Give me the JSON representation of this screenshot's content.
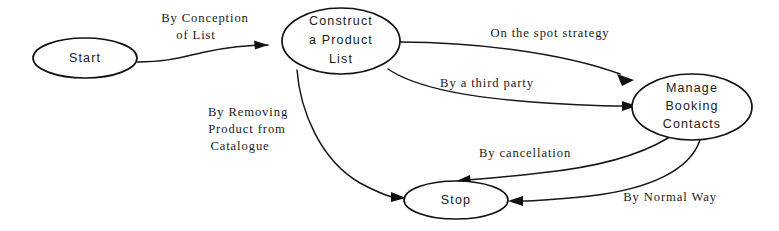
{
  "diagram": {
    "type": "state-transition-diagram",
    "background_color": "#ffffff",
    "stroke_color": "#171717",
    "text_color": "#1a1a1a",
    "nodes": [
      {
        "id": "start",
        "name": "start-node",
        "label_lines": [
          "Start"
        ],
        "cx": 85,
        "cy": 58,
        "rx": 52,
        "ry": 20
      },
      {
        "id": "construct",
        "name": "construct-product-list-node",
        "label_lines": [
          "Construct",
          "a Product",
          "List"
        ],
        "cx": 341,
        "cy": 41,
        "rx": 59,
        "ry": 33
      },
      {
        "id": "manage",
        "name": "manage-booking-contacts-node",
        "label_lines": [
          "Manage",
          "Booking",
          "Contacts"
        ],
        "cx": 692,
        "cy": 107,
        "rx": 60,
        "ry": 33
      },
      {
        "id": "stop",
        "name": "stop-node",
        "label_lines": [
          "Stop"
        ],
        "cx": 456,
        "cy": 200,
        "rx": 52,
        "ry": 19
      }
    ],
    "edges": [
      {
        "id": "start-to-construct",
        "name": "edge-start-to-construct",
        "from": "start",
        "to": "construct",
        "label_lines": [
          "By Conception",
          "of List"
        ],
        "label_x": 205,
        "label_y": 26
      },
      {
        "id": "construct-to-manage-spot",
        "name": "edge-construct-to-manage-on-the-spot",
        "from": "construct",
        "to": "manage",
        "label_lines": [
          "On the spot strategy"
        ],
        "label_x": 550,
        "label_y": 34
      },
      {
        "id": "construct-to-manage-third-party",
        "name": "edge-construct-to-manage-third-party",
        "from": "construct",
        "to": "manage",
        "label_lines": [
          "By a third party"
        ],
        "label_x": 487,
        "label_y": 84
      },
      {
        "id": "construct-to-stop",
        "name": "edge-construct-to-stop-removing-product",
        "from": "construct",
        "to": "stop",
        "label_lines": [
          "By Removing",
          "Product from",
          "Catalogue"
        ],
        "label_x": 248,
        "label_y": 115
      },
      {
        "id": "manage-to-stop-cancellation",
        "name": "edge-manage-to-stop-cancellation",
        "from": "manage",
        "to": "stop",
        "label_lines": [
          "By cancellation"
        ],
        "label_x": 525,
        "label_y": 154
      },
      {
        "id": "manage-to-stop-normal",
        "name": "edge-manage-to-stop-normal-way",
        "from": "manage",
        "to": "stop",
        "label_lines": [
          "By Normal Way"
        ],
        "label_x": 670,
        "label_y": 198
      }
    ]
  }
}
